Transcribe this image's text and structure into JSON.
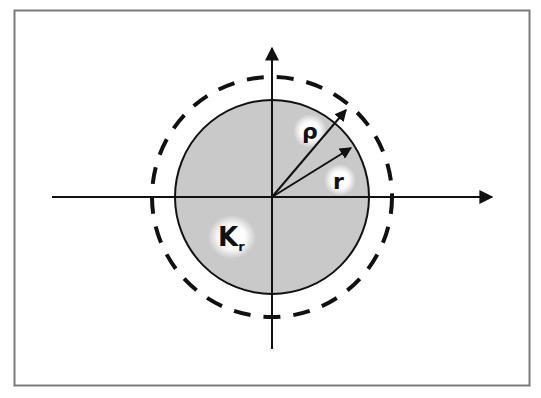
{
  "diagram": {
    "type": "geometric-figure",
    "colors": {
      "frame": "#7a7a7a",
      "disk_fill": "#c9c9c9",
      "stroke": "#111111",
      "background": "#ffffff"
    },
    "labels": {
      "rho": "ρ",
      "r": "r",
      "disk_main": "K",
      "disk_sub": "r"
    },
    "elements": {
      "x_axis": "horizontal axis with arrow",
      "y_axis": "vertical axis with arrow",
      "disk": "solid circle K_r (shaded)",
      "dashed_circle": "dashed circle of radius rho",
      "rho_vector": "radius vector rho",
      "r_vector": "radius vector r"
    }
  }
}
